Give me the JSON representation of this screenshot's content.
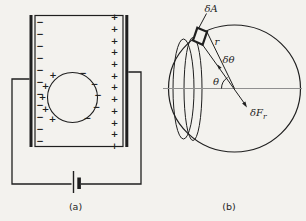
{
  "figure": {
    "background": "#f3f2ee",
    "ink": "#1f1f1f",
    "axis_color": "#8f8f8f",
    "panel_a": {
      "label": "(a)",
      "left_plate": {
        "sign": "−",
        "count": 11
      },
      "right_plate": {
        "sign": "+",
        "count": 12
      },
      "sphere_left": {
        "sign": "+",
        "count": 5
      },
      "sphere_right": {
        "sign": "−",
        "count": 5
      }
    },
    "panel_b": {
      "label": "(b)",
      "area_element_label": "δA",
      "radius_label": "r",
      "delta_angle_label": "δθ",
      "angle_label": "θ",
      "force_label": "δF",
      "force_subscript": "r"
    }
  }
}
